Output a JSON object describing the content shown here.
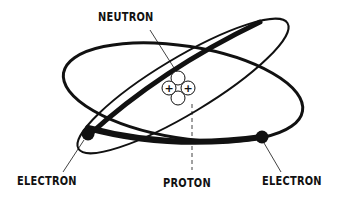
{
  "diagram": {
    "type": "atom-model",
    "labels": {
      "neutron": "NEUTRON",
      "proton": "PROTON",
      "electron_left": "ELECTRON",
      "electron_right": "ELECTRON"
    },
    "nucleus": {
      "particles": [
        {
          "kind": "neutron",
          "position": "top",
          "symbol": ""
        },
        {
          "kind": "proton",
          "position": "left",
          "symbol": "+"
        },
        {
          "kind": "proton",
          "position": "right",
          "symbol": "+"
        },
        {
          "kind": "neutron",
          "position": "bottom",
          "symbol": ""
        }
      ]
    },
    "orbits": 2,
    "electrons": 2,
    "colors": {
      "ink": "#111111",
      "background": "#ffffff"
    }
  }
}
